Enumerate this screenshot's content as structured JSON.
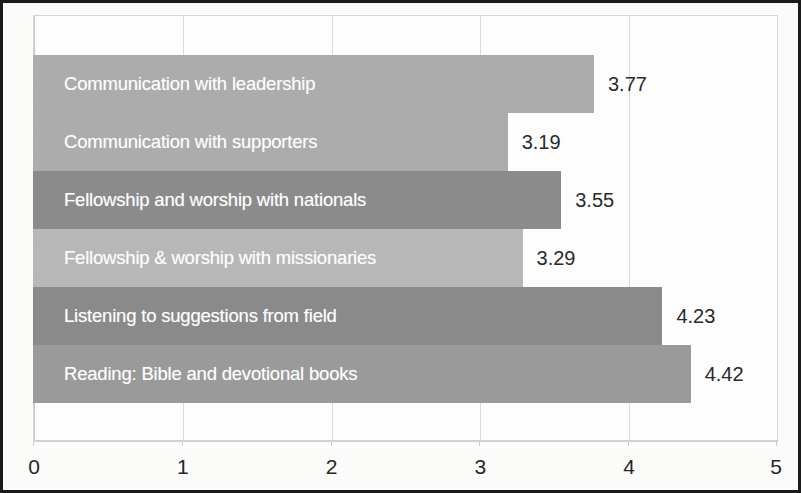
{
  "chart_data": {
    "type": "bar",
    "orientation": "horizontal",
    "title": "",
    "subtitle": "",
    "xlabel": "",
    "ylabel": "",
    "xlim": [
      0,
      5
    ],
    "grid": true,
    "legend": false,
    "xticks": [
      "0",
      "1",
      "2",
      "3",
      "4",
      "5"
    ],
    "xtick_values": [
      0,
      1,
      2,
      3,
      4,
      5
    ],
    "categories": [
      "Communication with leadership",
      "Communication with supporters",
      "Fellowship and worship with nationals",
      "Fellowship & worship with missionaries",
      "Listening to suggestions from field",
      "Reading: Bible and devotional books"
    ],
    "values": [
      3.77,
      3.19,
      3.55,
      3.29,
      4.23,
      4.42
    ],
    "value_labels": [
      "3.77",
      "3.19",
      "3.55",
      "3.29",
      "4.23",
      "4.42"
    ],
    "bar_colors": [
      "#adadad",
      "#adadad",
      "#8c8c8c",
      "#b9b9b9",
      "#8b8b8b",
      "#9b9b9b"
    ],
    "label_color": "#ffffff",
    "value_label_color": "#2b2b2b",
    "grid_color": "#dcdcdc",
    "plot_background": "#ffffff",
    "page_background": "#fdfdfc"
  }
}
